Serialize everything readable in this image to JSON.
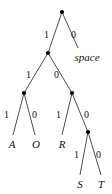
{
  "figure": {
    "type": "huffman-code-tree",
    "background_color": "#ffffff",
    "line_color": "#3a3a3a",
    "node_color": "#000000",
    "text_color": "#111111"
  },
  "nodes": [
    {
      "id": "root",
      "kind": "internal",
      "x": 62,
      "y": 12
    },
    {
      "id": "n1",
      "kind": "internal",
      "x": 48,
      "y": 53
    },
    {
      "id": "n2",
      "kind": "internal",
      "x": 24,
      "y": 93
    },
    {
      "id": "n3",
      "kind": "internal",
      "x": 72,
      "y": 93
    },
    {
      "id": "n4",
      "kind": "internal",
      "x": 88,
      "y": 132
    }
  ],
  "leaves": [
    {
      "id": "leaf-space",
      "label": "space",
      "code": "0",
      "x": 87,
      "y": 57,
      "anchor": "middle"
    },
    {
      "id": "leaf-a",
      "label": "A",
      "code": "111",
      "x": 12,
      "y": 144,
      "anchor": "middle"
    },
    {
      "id": "leaf-o",
      "label": "O",
      "code": "110",
      "x": 36,
      "y": 144,
      "anchor": "middle"
    },
    {
      "id": "leaf-r",
      "label": "R",
      "code": "101",
      "x": 62,
      "y": 144,
      "anchor": "middle"
    },
    {
      "id": "leaf-s",
      "label": "S",
      "code": "1001",
      "x": 80,
      "y": 184,
      "anchor": "middle"
    },
    {
      "id": "leaf-t",
      "label": "T",
      "code": "1000",
      "x": 101,
      "y": 184,
      "anchor": "middle"
    }
  ],
  "edges": [
    {
      "id": "e-root-left",
      "from": "root",
      "to": "n1",
      "bit": "1",
      "x1": 62,
      "y1": 12,
      "x2": 48,
      "y2": 53,
      "label_x": 44,
      "label_y": 30
    },
    {
      "id": "e-root-right",
      "from": "root",
      "to": "leaf-space",
      "bit": "0",
      "x1": 62,
      "y1": 12,
      "x2": 78,
      "y2": 48,
      "label_x": 71,
      "label_y": 30
    },
    {
      "id": "e-n1-left",
      "from": "n1",
      "to": "n2",
      "bit": "1",
      "x1": 48,
      "y1": 53,
      "x2": 24,
      "y2": 93,
      "label_x": 26,
      "label_y": 70
    },
    {
      "id": "e-n1-right",
      "from": "n1",
      "to": "n3",
      "bit": "0",
      "x1": 48,
      "y1": 53,
      "x2": 72,
      "y2": 93,
      "label_x": 54,
      "label_y": 70
    },
    {
      "id": "e-n2-left",
      "from": "n2",
      "to": "leaf-a",
      "bit": "1",
      "x1": 24,
      "y1": 93,
      "x2": 13,
      "y2": 135,
      "label_x": 4,
      "label_y": 110
    },
    {
      "id": "e-n2-right",
      "from": "n2",
      "to": "leaf-o",
      "bit": "0",
      "x1": 24,
      "y1": 93,
      "x2": 35,
      "y2": 135,
      "label_x": 32,
      "label_y": 110
    },
    {
      "id": "e-n3-left",
      "from": "n3",
      "to": "leaf-r",
      "bit": "1",
      "x1": 72,
      "y1": 93,
      "x2": 62,
      "y2": 135,
      "label_x": 56,
      "label_y": 110
    },
    {
      "id": "e-n3-right",
      "from": "n3",
      "to": "n4",
      "bit": "0",
      "x1": 72,
      "y1": 93,
      "x2": 88,
      "y2": 132,
      "label_x": 84,
      "label_y": 110
    },
    {
      "id": "e-n4-left",
      "from": "n4",
      "to": "leaf-s",
      "bit": "1",
      "x1": 88,
      "y1": 132,
      "x2": 80,
      "y2": 175,
      "label_x": 74,
      "label_y": 150
    },
    {
      "id": "e-n4-right",
      "from": "n4",
      "to": "leaf-t",
      "bit": "0",
      "x1": 88,
      "y1": 132,
      "x2": 101,
      "y2": 175,
      "label_x": 96,
      "label_y": 150
    }
  ]
}
